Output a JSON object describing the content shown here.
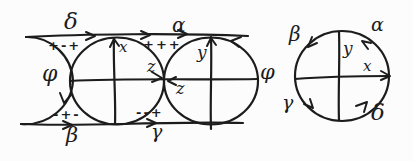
{
  "colors": {
    "ink": "#1c1c1c",
    "paper": "#fcfcfc"
  },
  "left_diagram": {
    "edge_labels": {
      "delta_top": "δ",
      "alpha_top": "α",
      "phi_left": "φ",
      "phi_right": "φ",
      "beta_bottom": "β",
      "gamma_bottom": "γ"
    },
    "sign_labels": {
      "top_left": "+-+",
      "top_middle": "+++",
      "bottom_left": "-+-",
      "bottom_middle": "--+"
    },
    "point_labels": {
      "x": "x",
      "y": "y",
      "z_upper": "z",
      "z_lower": "z"
    }
  },
  "right_diagram": {
    "edge_labels": {
      "beta_top_left": "β",
      "alpha_top_right": "α",
      "gamma_bottom_left": "γ",
      "delta_bottom_right": "δ"
    },
    "point_labels": {
      "y": "y",
      "x": "x"
    }
  }
}
